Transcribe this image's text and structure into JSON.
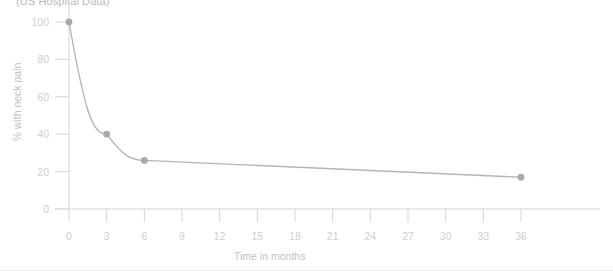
{
  "chart_data": {
    "type": "line",
    "title": "(US Hospital Data)",
    "xlabel": "Time in months",
    "ylabel": "% with neck pain",
    "x": [
      0,
      3,
      6,
      36
    ],
    "values": [
      100,
      40,
      26,
      17
    ],
    "series": [
      {
        "name": "% with neck pain",
        "x": [
          0,
          3,
          6,
          36
        ],
        "values": [
          100,
          40,
          26,
          17
        ]
      }
    ],
    "xlim": [
      0,
      36
    ],
    "ylim": [
      0,
      100
    ],
    "xticks": [
      0,
      3,
      6,
      9,
      12,
      15,
      18,
      21,
      24,
      27,
      30,
      33,
      36
    ],
    "yticks": [
      0,
      20,
      40,
      60,
      80,
      100
    ],
    "xtick_labels": [
      "0",
      "3",
      "6",
      "9",
      "12",
      "15",
      "18",
      "21",
      "24",
      "27",
      "30",
      "33",
      "36"
    ],
    "ytick_labels": [
      "0",
      "20",
      "40",
      "60",
      "80",
      "100"
    ],
    "grid": false,
    "legend": false,
    "marker": "circle",
    "line_color": "#b5b5b5",
    "marker_color": "#a9a9a9",
    "axis_color": "#d5d5d5",
    "text_color": "#c6c6c6"
  }
}
